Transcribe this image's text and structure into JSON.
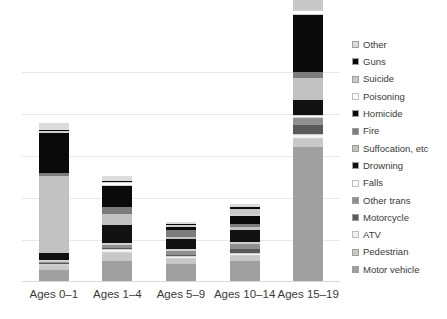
{
  "chart_data": {
    "type": "bar",
    "subtype": "stacked-bar",
    "title": "",
    "xlabel": "",
    "ylabel": "",
    "grid": true,
    "gridlines": 5,
    "legend_position": "right",
    "ylim": [
      0,
      2100
    ],
    "categories": [
      "Ages 0–1",
      "Ages 1–4",
      "Ages 5–9",
      "Ages 10–14",
      "Ages 15–19"
    ],
    "series": [
      {
        "name": "Motor vehicle",
        "color": "#a0a0a0",
        "values": [
          95,
          165,
          140,
          170,
          1120
        ]
      },
      {
        "name": "Pedestrian",
        "color": "#c8c8c8",
        "values": [
          30,
          70,
          45,
          40,
          62
        ]
      },
      {
        "name": "ATV",
        "color": "#f2f2f2",
        "values": [
          12,
          30,
          20,
          22,
          40
        ]
      },
      {
        "name": "Motorcycle",
        "color": "#5a5a5a",
        "values": [
          8,
          12,
          12,
          38,
          75
        ]
      },
      {
        "name": "Other trans",
        "color": "#909090",
        "values": [
          10,
          22,
          30,
          40,
          60
        ]
      },
      {
        "name": "Falls",
        "color": "#ffffff",
        "values": [
          10,
          14,
          10,
          16,
          28
        ]
      },
      {
        "name": "Drowning",
        "color": "#111111",
        "values": [
          55,
          150,
          85,
          95,
          120
        ]
      },
      {
        "name": "Suffocation, etc",
        "color": "#c2c2c2",
        "values": [
          640,
          95,
          20,
          30,
          190
        ]
      },
      {
        "name": "Fire",
        "color": "#7c7c7c",
        "values": [
          30,
          60,
          55,
          28,
          45
        ]
      },
      {
        "name": "Homicide",
        "color": "#0a0a0a",
        "values": [
          330,
          175,
          30,
          60,
          480
        ]
      },
      {
        "name": "Poisoning",
        "color": "#ffffff",
        "values": [
          22,
          28,
          10,
          20,
          40
        ]
      },
      {
        "name": "Suicide",
        "color": "#c8c8c8",
        "values": [
          0,
          0,
          0,
          45,
          390
        ]
      },
      {
        "name": "Guns",
        "color": "#0a0a0a",
        "values": [
          8,
          10,
          8,
          14,
          45
        ]
      },
      {
        "name": "Other",
        "color": "#dcdcdc",
        "values": [
          60,
          40,
          10,
          22,
          45
        ]
      }
    ]
  },
  "legend": {
    "items": [
      {
        "label": "Other",
        "color": "#dcdcdc"
      },
      {
        "label": "Guns",
        "color": "#0a0a0a"
      },
      {
        "label": "Suicide",
        "color": "#c8c8c8"
      },
      {
        "label": "Poisoning",
        "color": "#ffffff"
      },
      {
        "label": "Homicide",
        "color": "#0a0a0a"
      },
      {
        "label": "Fire",
        "color": "#7c7c7c"
      },
      {
        "label": "Suffocation, etc",
        "color": "#c2c2c2"
      },
      {
        "label": "Drowning",
        "color": "#111111"
      },
      {
        "label": "Falls",
        "color": "#ffffff"
      },
      {
        "label": "Other trans",
        "color": "#909090"
      },
      {
        "label": "Motorcycle",
        "color": "#5a5a5a"
      },
      {
        "label": "ATV",
        "color": "#f2f2f2"
      },
      {
        "label": "Pedestrian",
        "color": "#c8c8c8"
      },
      {
        "label": "Motor vehicle",
        "color": "#a0a0a0"
      }
    ]
  },
  "style": {
    "grid_color": "#e8e8e8",
    "axis_color": "#d9d9d9",
    "text_color": "#3a3a3a",
    "background": "#ffffff",
    "segment_border": "#f5f5f5"
  }
}
